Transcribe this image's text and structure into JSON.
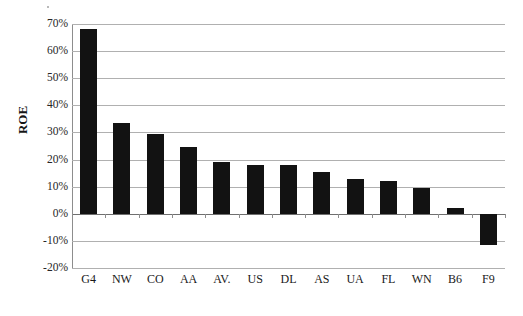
{
  "chart_data": {
    "type": "bar",
    "title": "",
    "xlabel": "",
    "ylabel": "ROE",
    "categories": [
      "G4",
      "NW",
      "CO",
      "AA",
      "AV.",
      "US",
      "DL",
      "AS",
      "UA",
      "FL",
      "WN",
      "B6",
      "F9"
    ],
    "values": [
      0.68,
      0.335,
      0.295,
      0.245,
      0.19,
      0.18,
      0.18,
      0.155,
      0.13,
      0.12,
      0.095,
      0.02,
      -0.115
    ],
    "value_labels": [
      "68%",
      "33.5%",
      "29.5%",
      "24.5%",
      "19%",
      "18%",
      "18%",
      "15.5%",
      "13%",
      "12%",
      "9.5%",
      "2%",
      "-11.5%"
    ],
    "ylim": [
      -0.2,
      0.7
    ],
    "ytick_values": [
      0.7,
      0.6,
      0.5,
      0.4,
      0.3,
      0.2,
      0.1,
      0.0,
      -0.1,
      -0.2
    ],
    "ytick_labels": [
      "70%",
      "60%",
      "50%",
      "40%",
      "30%",
      "20%",
      "10%",
      "0%",
      "-10%",
      "-20%"
    ],
    "grid": true,
    "legend": "none",
    "bar_color": "#121212",
    "gridline_color": "#b0b0b0",
    "axis_color": "#8d8d8d"
  }
}
